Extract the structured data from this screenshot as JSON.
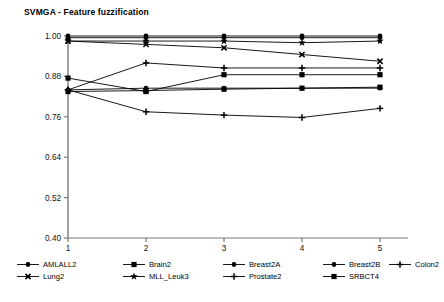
{
  "chart_data": {
    "type": "line",
    "title": "SVMGA - Feature fuzzification",
    "xlabel": "",
    "ylabel": "",
    "x": [
      1,
      2,
      3,
      4,
      5
    ],
    "categories": [
      "1",
      "2",
      "3",
      "4",
      "5"
    ],
    "xticklabels": [
      "1",
      "2",
      "3",
      "4",
      "5"
    ],
    "yticklabels": [
      "1.00",
      "0.88",
      "0.76",
      "0.64",
      "0.52",
      "0.40"
    ],
    "yticks": [
      1.0,
      0.88,
      0.76,
      0.64,
      0.52,
      0.4
    ],
    "ylim": [
      0.4,
      1.0
    ],
    "xlim": [
      1,
      5
    ],
    "grid": false,
    "legend_position": "bottom",
    "line_color": "#000000",
    "series": [
      {
        "name": "AMLALL2",
        "marker": "circle",
        "values": [
          1.0,
          1.0,
          1.0,
          1.0,
          1.0
        ]
      },
      {
        "name": "Brain2",
        "marker": "square",
        "values": [
          0.875,
          0.835,
          0.885,
          0.885,
          0.885
        ]
      },
      {
        "name": "Breast2A",
        "marker": "circle",
        "values": [
          0.995,
          0.995,
          0.995,
          0.995,
          0.995
        ]
      },
      {
        "name": "Breast2B",
        "marker": "circle",
        "values": [
          0.84,
          0.845,
          0.845,
          0.845,
          0.845
        ]
      },
      {
        "name": "Colon2",
        "marker": "plus",
        "values": [
          0.84,
          0.92,
          0.905,
          0.905,
          0.905
        ]
      },
      {
        "name": "Lung2",
        "marker": "cross",
        "values": [
          0.985,
          0.975,
          0.965,
          0.945,
          0.925
        ]
      },
      {
        "name": "MLL_Leuk3",
        "marker": "star",
        "values": [
          0.985,
          0.985,
          0.985,
          0.98,
          0.985
        ]
      },
      {
        "name": "Prostate2",
        "marker": "plus",
        "values": [
          0.84,
          0.775,
          0.765,
          0.758,
          0.785
        ]
      },
      {
        "name": "SRBCT4",
        "marker": "square",
        "values": [
          0.835,
          0.838,
          0.842,
          0.845,
          0.848
        ]
      }
    ]
  },
  "legend": {
    "items": [
      {
        "label": "AMLALL2",
        "marker": "circle"
      },
      {
        "label": "Brain2",
        "marker": "square"
      },
      {
        "label": "Breast2A",
        "marker": "circle"
      },
      {
        "label": "Breast2B",
        "marker": "circle"
      },
      {
        "label": "Colon2",
        "marker": "plus"
      },
      {
        "label": "Lung2",
        "marker": "cross"
      },
      {
        "label": "MLL_Leuk3",
        "marker": "star"
      },
      {
        "label": "Prostate2",
        "marker": "plus"
      },
      {
        "label": "SRBCT4",
        "marker": "square"
      }
    ]
  }
}
